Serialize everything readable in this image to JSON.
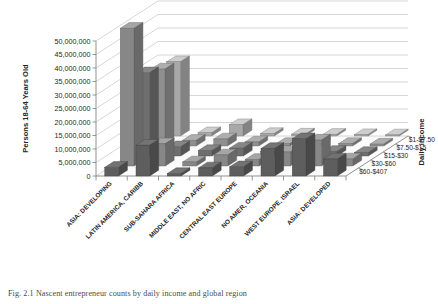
{
  "figure": {
    "caption": "Fig. 2.1 Nascent entrepreneur counts by daily income and global region"
  },
  "chart_data": {
    "type": "bar",
    "subtype": "3d-grouped-bar",
    "title": "",
    "xlabel": "",
    "ylabel": "Persons 18-64 Years Old",
    "zlabel": "Daily income",
    "grid": true,
    "legend_position": "right-depth-axis",
    "ylim": [
      0,
      50000000
    ],
    "ytick_labels": [
      "50,000,000",
      "45,000,000",
      "40,000,000",
      "35,000,000",
      "30,000,000",
      "25,000,000",
      "20,000,000",
      "15,000,000",
      "10,000,000",
      "5,000,000",
      "0"
    ],
    "ytick_values": [
      50000000,
      45000000,
      40000000,
      35000000,
      30000000,
      25000000,
      20000000,
      15000000,
      10000000,
      5000000,
      0
    ],
    "categories": [
      "ASIA: DEVELOPING",
      "LATIN AMERICA, CARIBB",
      "SUB-SAHARA AFRICA",
      "MIDDLE EAST, NO AFRIC",
      "CENTRAL EAST EUROPE",
      "NO AMER, OCEANIA",
      "WEST EUROPE, ISRAEL",
      "ASIA: DEVELOPED"
    ],
    "series": [
      {
        "name": "$1-$7.50",
        "color": "#a8a8a8",
        "values": [
          27500000,
          1200000,
          4200000,
          900000,
          700000,
          600000,
          500000,
          400000
        ]
      },
      {
        "name": "$7.50-$15",
        "color": "#8f8f8f",
        "values": [
          28500000,
          2100000,
          2600000,
          1500000,
          900000,
          1100000,
          900000,
          700000
        ]
      },
      {
        "name": "$15-$30",
        "color": "#6e6e6e",
        "values": [
          30800000,
          3400000,
          2000000,
          2900000,
          1600000,
          2200000,
          1700000,
          1300000
        ]
      },
      {
        "name": "$30-$60",
        "color": "#878787",
        "values": [
          51000000,
          8200000,
          1500000,
          4100000,
          2400000,
          5200000,
          9600000,
          2600000
        ]
      },
      {
        "name": "$60-$407",
        "color": "#5e5e5e",
        "values": [
          3200000,
          11400000,
          900000,
          3000000,
          3400000,
          10200000,
          13800000,
          6300000
        ]
      }
    ]
  }
}
